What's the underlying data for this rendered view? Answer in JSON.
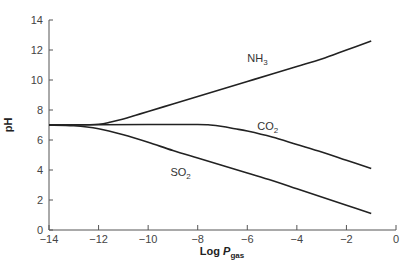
{
  "chart_data": {
    "type": "line",
    "title": "",
    "xlabel": "Log P_gas",
    "xlabel_main": "Log ",
    "xlabel_italic": "P",
    "xlabel_sub": "gas",
    "ylabel": "pH",
    "xlim": [
      -14,
      0
    ],
    "ylim": [
      0,
      14
    ],
    "xticks": [
      -14,
      -12,
      -10,
      -8,
      -6,
      -4,
      -2,
      0
    ],
    "xtick_labels": [
      "−14",
      "−12",
      "−10",
      "−8",
      "−6",
      "−4",
      "−2",
      "0"
    ],
    "yticks": [
      0,
      2,
      4,
      6,
      8,
      10,
      12,
      14
    ],
    "ytick_labels": [
      "0",
      "2",
      "4",
      "6",
      "8",
      "10",
      "12",
      "14"
    ],
    "grid": false,
    "legend": "inline labels",
    "series": [
      {
        "name": "NH3",
        "label_main": "NH",
        "label_sub": "3",
        "label_pos": [
          -6.0,
          11.2
        ],
        "x": [
          -14,
          -13,
          -12,
          -11.5,
          -11,
          -10.5,
          -10,
          -9,
          -8,
          -7,
          -6,
          -5,
          -4,
          -3,
          -2,
          -1
        ],
        "y": [
          7.0,
          7.0,
          7.05,
          7.2,
          7.4,
          7.65,
          7.9,
          8.4,
          8.9,
          9.4,
          9.9,
          10.4,
          10.9,
          11.4,
          12.0,
          12.6
        ]
      },
      {
        "name": "CO2",
        "label_main": "CO",
        "label_sub": "2",
        "label_pos": [
          -5.6,
          6.7
        ],
        "x": [
          -14,
          -12,
          -10,
          -8,
          -7.5,
          -7,
          -6.5,
          -6,
          -5,
          -4,
          -3,
          -2,
          -1
        ],
        "y": [
          7.0,
          7.02,
          7.03,
          7.03,
          7.0,
          6.9,
          6.75,
          6.6,
          6.2,
          5.7,
          5.2,
          4.65,
          4.1
        ]
      },
      {
        "name": "SO2",
        "label_main": "SO",
        "label_sub": "2",
        "label_pos": [
          -9.1,
          3.6
        ],
        "x": [
          -14,
          -13,
          -12,
          -11,
          -10,
          -9,
          -8,
          -7,
          -6,
          -5,
          -4,
          -3,
          -2,
          -1
        ],
        "y": [
          7.0,
          6.95,
          6.75,
          6.35,
          5.85,
          5.3,
          4.8,
          4.3,
          3.8,
          3.3,
          2.75,
          2.2,
          1.65,
          1.1
        ]
      }
    ]
  }
}
